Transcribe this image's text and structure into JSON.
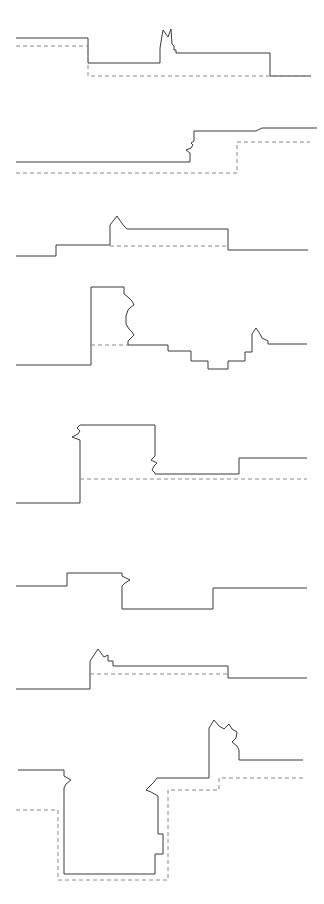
{
  "figure": {
    "title": "",
    "background_color": "#ffffff",
    "width": 324,
    "height": 904,
    "panel_count": 8
  },
  "style": {
    "solid_stroke_color": "#3a3a3a",
    "dashed_stroke_color": "#8a8a8a",
    "stroke_width": 1,
    "dash_pattern": "4 3"
  },
  "chart_data": {
    "type": "line",
    "title": "",
    "subtitle": "",
    "xlabel": "",
    "ylabel": "",
    "grid": false,
    "legend": null,
    "panels": [
      {
        "index": 1,
        "name": "panel-1",
        "top": 0,
        "height": 104,
        "xlim": [
          0,
          324
        ],
        "ylim": [
          0,
          104
        ],
        "series": [
          {
            "name": "solid-trace-1",
            "style": "solid",
            "points": "16,38 88,38 88,63 160,63 160,48 163,30 168,37 171,29 172,44 174,46 174,50 176,50 176,53 270,53 270,76 311,76"
          },
          {
            "name": "dashed-reference-1",
            "style": "dashed",
            "points": "16,46 88,46 88,76 305,76"
          }
        ]
      },
      {
        "index": 2,
        "name": "panel-2",
        "top": 110,
        "height": 85,
        "xlim": [
          0,
          324
        ],
        "ylim": [
          0,
          85
        ],
        "series": [
          {
            "name": "solid-trace-2",
            "style": "solid",
            "points": "16,52 190,52 190,43 186,40 191,38 193,35 191,33 194,31 194,21 256,21 262,18 317,18"
          },
          {
            "name": "dashed-reference-2",
            "style": "dashed",
            "points": "16,63 237,63 237,32 310,32"
          }
        ]
      },
      {
        "index": 3,
        "name": "panel-3",
        "top": 198,
        "height": 70,
        "xlim": [
          0,
          324
        ],
        "ylim": [
          0,
          70
        ],
        "series": [
          {
            "name": "solid-trace-3",
            "style": "solid",
            "points": "16,58 56,58 56,47 110,47 110,27 117,18 121,24 124,28 127,31 228,31 228,52 308,52"
          },
          {
            "name": "dashed-reference-3",
            "style": "dashed",
            "points": "110,48 228,48"
          }
        ]
      },
      {
        "index": 4,
        "name": "panel-4",
        "top": 272,
        "height": 110,
        "xlim": [
          0,
          324
        ],
        "ylim": [
          0,
          110
        ],
        "series": [
          {
            "name": "solid-trace-4",
            "style": "solid",
            "points": "16,93 91,93 91,15 124,15 124,22 128,25 132,29 134,33 131,35 128,38 126,44 126,52 129,57 132,60 134,63 131,66 128,69 128,73 168,73 168,79 191,79 191,89 208,89 208,97 228,97 228,89 245,89 245,80 252,80 252,62 256,56 260,62 262,66 268,69 268,72 307,72"
          },
          {
            "name": "dashed-reference-4",
            "style": "dashed",
            "points": "91,73 128,73"
          }
        ]
      },
      {
        "index": 5,
        "name": "panel-5",
        "top": 406,
        "height": 100,
        "xlim": [
          0,
          324
        ],
        "ylim": [
          0,
          100
        ],
        "series": [
          {
            "name": "solid-trace-5",
            "style": "solid",
            "points": "16,97 80,97 80,34 72,31 78,28 80,25 77,22 80,19 155,19 155,50 151,54 157,57 154,60 152,64 155,67 155,68 239,68 239,52 307,52"
          },
          {
            "name": "dashed-reference-5",
            "style": "dashed",
            "points": "80,73 307,73"
          }
        ]
      },
      {
        "index": 6,
        "name": "panel-6",
        "top": 548,
        "height": 75,
        "xlim": [
          0,
          324
        ],
        "ylim": [
          0,
          75
        ],
        "series": [
          {
            "name": "solid-trace-6",
            "style": "solid",
            "points": "16,38 67,38 67,25 122,25 122,28 130,32 125,35 122,38 122,61 213,61 213,40 307,40"
          }
        ]
      },
      {
        "index": 7,
        "name": "panel-7",
        "top": 628,
        "height": 75,
        "xlim": [
          0,
          324
        ],
        "ylim": [
          0,
          75
        ],
        "series": [
          {
            "name": "solid-trace-7",
            "style": "solid",
            "points": "16,61 90,61 90,33 98,21 104,29 108,27 108,33 113,33 113,38 228,38 228,50 307,50"
          },
          {
            "name": "dashed-reference-7",
            "style": "dashed",
            "points": "90,46 228,46"
          }
        ]
      },
      {
        "index": 8,
        "name": "panel-8",
        "top": 704,
        "height": 200,
        "xlim": [
          0,
          324
        ],
        "ylim": [
          0,
          200
        ],
        "series": [
          {
            "name": "solid-trace-8",
            "style": "solid",
            "points": "18,66 64,66 64,72 71,76 66,80 64,84 64,170 155,170 155,150 163,150 163,130 158,130 158,92 151,88 146,86 150,82 154,78 157,74 209,74 209,24 214,16 219,22 224,25 229,20 232,25 237,28 236,34 232,38 237,42 239,46 239,56 303,56"
          },
          {
            "name": "dashed-reference-8",
            "style": "dashed",
            "points": "16,106 58,106 58,176 168,176 168,86 219,86 219,74 305,74"
          }
        ]
      }
    ]
  }
}
